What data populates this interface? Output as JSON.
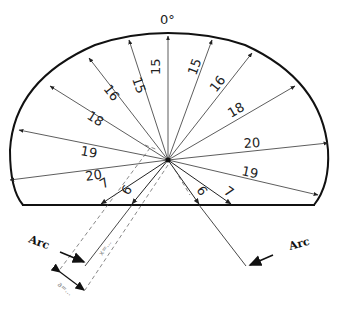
{
  "diagram": {
    "top_label": "0°",
    "center": {
      "x": 168,
      "y": 160
    },
    "outline": {
      "stroke": "#111111"
    },
    "rays_upper_left": [
      {
        "label": "15",
        "angle_deg": 0,
        "position": "vertical"
      },
      {
        "label": "15",
        "angle_deg": -20
      },
      {
        "label": "16",
        "angle_deg": -38
      },
      {
        "label": "18",
        "angle_deg": -56
      },
      {
        "label": "19",
        "angle_deg": -76
      },
      {
        "label": "20",
        "angle_deg": -96
      }
    ],
    "rays_upper_right": [
      {
        "label": "15",
        "angle_deg": 20
      },
      {
        "label": "16",
        "angle_deg": 38
      },
      {
        "label": "18",
        "angle_deg": 57
      },
      {
        "label": "20",
        "angle_deg": 80
      },
      {
        "label": "19",
        "angle_deg": 104
      }
    ],
    "rays_lower": [
      {
        "label": "7",
        "side": "left"
      },
      {
        "label": "6",
        "side": "left"
      },
      {
        "label": "6",
        "side": "right"
      },
      {
        "label": "7",
        "side": "right"
      }
    ],
    "arc_labels": [
      {
        "text": "Arc",
        "side": "left"
      },
      {
        "text": "Arc",
        "side": "right"
      }
    ],
    "dimension_labels": [
      {
        "text": "x=...",
        "note": "small dimension along electrode"
      },
      {
        "text": "a=...",
        "note": "small offset dimension"
      }
    ]
  }
}
